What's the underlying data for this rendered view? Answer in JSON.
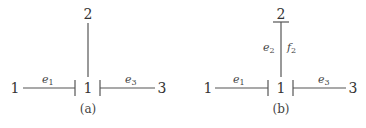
{
  "panels": [
    {
      "caption": "(a)",
      "nodes": {
        "left": "1",
        "center": "1",
        "right": "3",
        "top": "2"
      },
      "edges": {
        "left": {
          "label": "e",
          "sub": "1"
        },
        "right": {
          "label": "e",
          "sub": "3"
        }
      }
    },
    {
      "caption": "(b)",
      "nodes": {
        "left": "1",
        "center": "1",
        "right": "3",
        "top": "2"
      },
      "edges": {
        "left": {
          "label": "e",
          "sub": "1"
        },
        "right": {
          "label": "e",
          "sub": "3"
        },
        "top_left": {
          "label": "e",
          "sub": "2"
        },
        "top_right": {
          "label": "f",
          "sub": "2"
        }
      }
    }
  ]
}
